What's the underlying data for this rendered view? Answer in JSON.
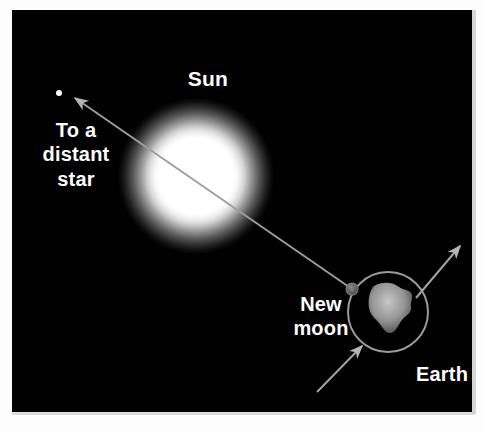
{
  "figure": {
    "background_color": "#010101",
    "page_color": "#ffffff",
    "width": 486,
    "height": 432
  },
  "labels": {
    "sun": "Sun",
    "distant_star": "To a\ndistant\nstar",
    "new_moon": "New\nmoon",
    "earth": "Earth"
  },
  "bodies": {
    "sun": {
      "name": "Sun",
      "center_x": 184,
      "center_y": 166,
      "core_radius": 38,
      "glow_radius": 78,
      "core_color": "#ffffff",
      "glow_color": "#8e8e8e"
    },
    "earth": {
      "name": "Earth",
      "center_x": 376,
      "center_y": 302,
      "radius": 40,
      "ring_color": "#9a9a9a",
      "landmass_color": "#b8b8b8"
    },
    "new_moon": {
      "name": "New moon",
      "center_x": 340,
      "center_y": 279,
      "radius": 6,
      "color": "#6a6a6a"
    },
    "distant_star": {
      "name": "Distant star",
      "center_x": 47,
      "center_y": 83,
      "radius": 3,
      "color": "#ffffff"
    }
  },
  "sight_line": {
    "name": "line of sight to distant star",
    "from_x": 340,
    "from_y": 279,
    "to_x": 63,
    "to_y": 88,
    "color": "#9e9e9e",
    "has_arrowhead": true,
    "arrow_end": "distant star"
  },
  "orbit_arrows": [
    {
      "name": "earth-orbit-arrow-upper-right",
      "from_x": 404,
      "from_y": 288,
      "to_x": 448,
      "to_y": 236,
      "direction": "up-right",
      "color": "#a3a3a3"
    },
    {
      "name": "earth-orbit-arrow-lower-left",
      "from_x": 305,
      "from_y": 382,
      "to_x": 350,
      "to_y": 336,
      "direction": "up-right",
      "color": "#a3a3a3"
    }
  ],
  "colors": {
    "sky": "#010101",
    "text": "#ffffff",
    "line": "#9e9e9e",
    "ring": "#9a9a9a"
  }
}
